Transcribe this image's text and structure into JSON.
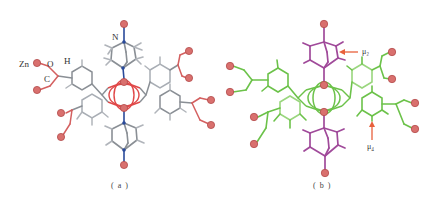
{
  "figure": {
    "panels": [
      {
        "id": "a",
        "caption": "( a )",
        "colors": {
          "bond": "#8a8f95",
          "bond_dark": "#5b6068",
          "nitrogen": "#2a4a9a",
          "oxygen": "#e04848",
          "zinc": "#d9706e",
          "zinc_edge": "#b24a4a",
          "hydrogen": "#b0b4ba"
        },
        "atom_labels": [
          {
            "text": "Zn",
            "x": 19,
            "y": 60
          },
          {
            "text": "O",
            "x": 47,
            "y": 60
          },
          {
            "text": "H",
            "x": 64,
            "y": 57
          },
          {
            "text": "C",
            "x": 44,
            "y": 75
          },
          {
            "text": "N",
            "x": 112,
            "y": 33
          }
        ],
        "zinc_atoms": [
          [
            124,
            24
          ],
          [
            124,
            82
          ],
          [
            124,
            108
          ],
          [
            124,
            165
          ],
          [
            37,
            63
          ],
          [
            37,
            90
          ],
          [
            61,
            113
          ],
          [
            61,
            137
          ],
          [
            189,
            51
          ],
          [
            189,
            78
          ],
          [
            211,
            100
          ],
          [
            211,
            125
          ]
        ]
      },
      {
        "id": "b",
        "caption": "( b )",
        "colors": {
          "ligand": "#6cc24a",
          "ligand_light": "#9ad67e",
          "dabco": "#a04a9a",
          "zinc": "#d9706e",
          "zinc_edge": "#b24a4a",
          "arrow": "#e8603c"
        },
        "annotations": [
          {
            "text": "μ₂",
            "x": 362,
            "y": 48
          },
          {
            "text": "μ₄",
            "x": 367,
            "y": 143
          }
        ],
        "zinc_atoms": [
          [
            324,
            24
          ],
          [
            324,
            85
          ],
          [
            324,
            112
          ],
          [
            325,
            173
          ],
          [
            230,
            66
          ],
          [
            230,
            92
          ],
          [
            254,
            117
          ],
          [
            254,
            144
          ],
          [
            392,
            52
          ],
          [
            392,
            79
          ],
          [
            415,
            103
          ],
          [
            415,
            129
          ]
        ]
      }
    ]
  }
}
